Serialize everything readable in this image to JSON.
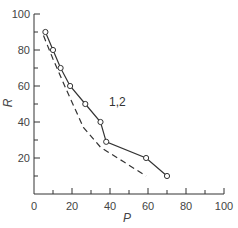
{
  "chart_data": {
    "type": "line",
    "title": "",
    "xlabel": "P",
    "ylabel": "R",
    "xlim": [
      0,
      100
    ],
    "ylim": [
      0,
      100
    ],
    "xticks": [
      0,
      20,
      40,
      60,
      80,
      100
    ],
    "yticks": [
      20,
      40,
      60,
      80,
      100
    ],
    "grid": false,
    "legend": null,
    "annotations": [
      {
        "text": "1,2",
        "x": 40,
        "y": 49
      }
    ],
    "series": [
      {
        "name": "1,2 (measured)",
        "style": "solid-with-circle-markers",
        "points": [
          [
            6,
            90
          ],
          [
            10,
            80
          ],
          [
            14,
            70
          ],
          [
            19,
            60
          ],
          [
            27,
            50
          ],
          [
            35,
            40
          ],
          [
            38,
            29
          ],
          [
            59,
            20
          ],
          [
            70,
            10
          ]
        ]
      },
      {
        "name": "dashed curve",
        "style": "dashed",
        "points": [
          [
            5,
            88
          ],
          [
            10,
            75
          ],
          [
            17,
            58
          ],
          [
            26,
            37
          ],
          [
            35,
            26
          ],
          [
            47,
            18
          ],
          [
            59,
            10
          ]
        ]
      }
    ]
  },
  "labels": {
    "x_axis": "P",
    "y_axis": "R",
    "annotation": "1,2",
    "x_tick_0": "0",
    "x_tick_20": "20",
    "x_tick_40": "40",
    "x_tick_60": "60",
    "x_tick_80": "80",
    "x_tick_100": "100",
    "y_tick_20": "20",
    "y_tick_40": "40",
    "y_tick_60": "60",
    "y_tick_80": "80",
    "y_tick_100": "100"
  }
}
